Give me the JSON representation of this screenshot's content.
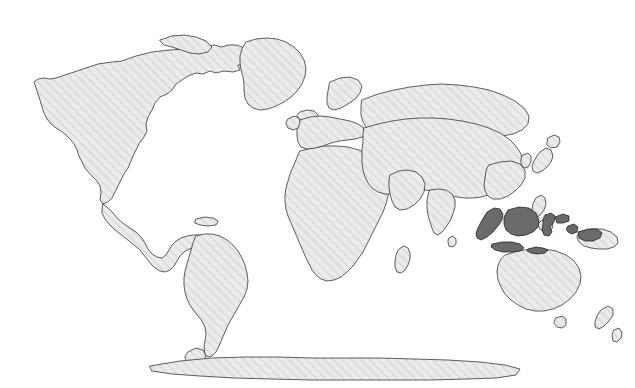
{
  "figure": {
    "kind": "world-map",
    "projection": "equirectangular",
    "width": 635,
    "height": 388,
    "title": "",
    "subtitle": "",
    "caption": "",
    "legend": "",
    "has_text_labels": false,
    "has_graticule": false,
    "has_border_frame": false
  },
  "style": {
    "ocean_color": "#ffffff",
    "background_color": "#ffffff",
    "land_base_color": "#ebebeb",
    "land_hatch_color": "#d6d6d6",
    "land_hatch_angle_deg": 45,
    "land_hatch_spacing_px": 4.5,
    "land_hatch_width_px": 1.6,
    "coastline_color": "#2b2b2b",
    "coastline_width_px": 0.75,
    "highlight_fill_color": "#6a6a6a",
    "highlight_stroke_color": "#1f1f1f",
    "highlight_stroke_width_px": 0.75
  },
  "highlight": {
    "country": "Indonesia",
    "is_highlighted": true,
    "fill": "#6a6a6a",
    "regions": [
      "Sumatra",
      "Java",
      "Kalimantan (Borneo)",
      "Sulawesi",
      "Lesser Sunda Islands",
      "Maluku Islands",
      "Western New Guinea"
    ]
  },
  "regions_rendered": [
    "North America",
    "Greenland",
    "Iceland",
    "Canadian Arctic Archipelago",
    "Central America",
    "Caribbean",
    "South America",
    "Tierra del Fuego",
    "Falkland Islands",
    "Europe",
    "British Isles",
    "Scandinavia",
    "Africa",
    "Madagascar",
    "Arabian Peninsula",
    "Asia",
    "India",
    "Sri Lanka",
    "Japan",
    "Korean Peninsula",
    "Philippines",
    "Indonesia",
    "Papua New Guinea",
    "Australia",
    "Tasmania",
    "New Zealand",
    "Antarctica"
  ],
  "geometry": {
    "north_america": "M 122 61 L 136 56 L 152 52 L 170 50 L 186 49 L 199 49 L 206 46 L 214 45 L 222 47 L 228 45 L 237 45 L 244 48 L 249 47 L 255 50 L 253 55 L 246 57 L 251 61 L 247 65 L 238 65 L 240 70 L 233 72 L 224 71 L 216 73 L 210 71 L 203 74 L 196 73 L 188 76 L 182 80 L 176 84 L 172 90 L 167 94 L 160 97 L 155 103 L 152 110 L 148 117 L 146 124 L 147 131 L 144 137 L 140 142 L 137 148 L 134 154 L 131 161 L 128 168 L 124 174 L 121 180 L 118 186 L 115 192 L 112 198 L 108 202 L 103 204 L 100 200 L 101 193 L 100 186 L 97 181 L 93 177 L 89 173 L 85 168 L 82 162 L 79 156 L 77 150 L 74 144 L 70 139 L 66 135 L 61 131 L 56 128 L 51 124 L 47 119 L 44 113 L 42 107 L 40 100 L 38 94 L 36 88 L 34 82 L 38 79 L 44 78 L 50 79 L 56 78 L 62 76 L 68 74 L 74 72 L 80 70 L 86 68 L 92 66 L 98 64 L 105 63 L 112 62 Z",
    "usa_mexico": "M 103 204 L 108 208 L 113 213 L 118 219 L 124 224 L 130 228 L 136 232 L 141 237 L 145 243 L 148 249 L 152 254 L 157 257 L 162 258 L 166 255 L 169 250 L 172 245 L 176 241 L 181 238 L 187 236 L 193 235 L 199 235 L 205 236 L 211 238 L 216 241 L 220 245 L 223 250 L 225 255 L 222 258 L 217 257 L 212 254 L 207 251 L 201 249 L 195 248 L 189 249 L 184 252 L 180 256 L 177 261 L 174 266 L 170 270 L 165 272 L 160 271 L 155 268 L 151 264 L 147 259 L 143 254 L 139 249 L 134 245 L 129 241 L 124 237 L 119 233 L 114 229 L 109 224 L 105 219 L 102 213 Z",
    "greenland": "M 246 42 L 256 39 L 267 38 L 277 39 L 286 42 L 294 47 L 300 53 L 304 60 L 306 68 L 305 76 L 302 84 L 297 91 L 291 97 L 284 102 L 276 106 L 268 109 L 260 110 L 253 108 L 248 104 L 245 98 L 244 91 L 244 84 L 243 77 L 241 70 L 240 63 L 240 56 L 242 49 Z",
    "iceland": "M 300 112 L 307 110 L 314 111 L 318 115 L 317 120 L 311 123 L 304 123 L 299 120 L 297 116 Z",
    "arctic_islands": "M 160 40 L 172 36 L 184 35 L 196 37 L 206 41 L 212 47 L 208 52 L 199 54 L 190 53 L 181 50 L 172 47 L 164 45 Z",
    "south_america": "M 196 236 L 204 234 L 212 234 L 220 236 L 227 240 L 233 245 L 238 251 L 242 258 L 245 265 L 247 273 L 248 281 L 247 289 L 244 297 L 240 304 L 236 311 L 232 318 L 228 325 L 225 332 L 222 339 L 219 346 L 216 352 L 212 356 L 208 357 L 205 354 L 204 348 L 205 341 L 206 334 L 205 327 L 202 321 L 198 316 L 194 311 L 190 305 L 187 299 L 185 292 L 184 285 L 184 278 L 185 271 L 187 264 L 189 257 L 191 250 L 193 243 Z",
    "africa": "M 300 151 L 312 148 L 324 146 L 336 146 L 348 147 L 359 150 L 368 154 L 376 159 L 382 165 L 386 172 L 388 180 L 389 188 L 388 196 L 386 204 L 383 212 L 379 220 L 375 228 L 371 236 L 367 244 L 363 252 L 358 259 L 353 266 L 347 272 L 341 277 L 334 280 L 327 281 L 321 279 L 316 275 L 312 270 L 309 264 L 306 258 L 303 251 L 300 244 L 297 237 L 294 230 L 291 223 L 288 216 L 286 209 L 285 202 L 285 195 L 286 188 L 288 181 L 290 174 L 293 167 L 296 160 Z",
    "madagascar": "M 399 249 L 404 246 L 408 248 L 410 253 L 410 259 L 408 265 L 405 270 L 401 273 L 397 272 L 395 267 L 395 261 L 396 255 Z",
    "europe": "M 300 120 L 310 117 L 320 116 L 330 117 L 340 119 L 350 121 L 358 124 L 364 128 L 366 133 L 362 137 L 355 139 L 347 140 L 339 141 L 331 143 L 323 146 L 315 148 L 307 149 L 301 147 L 298 142 L 297 136 L 297 130 L 298 124 Z",
    "british_isles": "M 288 119 L 294 116 L 299 118 L 300 123 L 298 128 L 293 130 L 288 128 L 286 124 Z",
    "scandinavia": "M 330 82 L 340 78 L 350 77 L 358 80 L 362 86 L 360 93 L 355 99 L 348 104 L 341 108 L 334 110 L 329 108 L 327 103 L 327 97 L 328 91 Z",
    "asia": "M 364 128 L 378 124 L 392 121 L 406 119 L 420 118 L 434 118 L 448 119 L 462 121 L 476 124 L 489 128 L 500 133 L 509 139 L 516 146 L 521 154 L 523 162 L 522 170 L 518 177 L 512 183 L 505 188 L 497 192 L 489 195 L 481 197 L 473 198 L 465 198 L 457 197 L 449 195 L 441 193 L 433 191 L 425 190 L 417 190 L 409 191 L 401 193 L 393 194 L 385 194 L 378 192 L 372 188 L 368 183 L 365 177 L 363 170 L 362 163 L 362 156 L 362 149 L 363 142 L 363 135 Z",
    "siberia_north": "M 362 100 L 378 94 L 394 90 L 410 87 L 426 85 L 442 84 L 458 85 L 474 87 L 489 90 L 503 95 L 515 101 L 524 108 L 529 116 L 528 124 L 522 130 L 513 134 L 502 136 L 490 137 L 478 137 L 466 136 L 454 135 L 442 134 L 430 134 L 418 135 L 406 136 L 394 137 L 383 136 L 374 133 L 367 128 L 363 122 L 361 115 L 361 107 Z",
    "india": "M 430 190 L 438 189 L 446 190 L 452 194 L 455 200 L 455 207 L 453 214 L 450 221 L 446 227 L 442 232 L 438 235 L 434 233 L 432 228 L 430 222 L 428 215 L 427 208 L 427 201 L 428 195 Z",
    "sri_lanka": "M 449 238 L 453 236 L 456 239 L 456 244 L 453 247 L 449 246 L 448 242 Z",
    "arabian_peninsula": "M 390 175 L 399 171 L 408 170 L 416 172 L 422 177 L 425 184 L 424 192 L 420 199 L 414 205 L 407 209 L 400 210 L 395 207 L 392 201 L 390 194 L 389 187 L 389 181 Z",
    "japan": "M 540 152 L 546 148 L 551 150 L 553 156 L 551 162 L 547 167 L 542 171 L 537 173 L 533 171 L 532 166 L 534 161 L 537 156 Z",
    "japan_north": "M 548 138 L 554 135 L 559 137 L 560 142 L 557 147 L 551 148 L 547 145 Z",
    "korea": "M 523 155 L 528 153 L 531 156 L 531 162 L 528 167 L 524 168 L 521 164 L 521 159 Z",
    "china_east": "M 489 165 L 500 162 L 511 161 L 520 164 L 525 170 L 525 178 L 521 185 L 515 191 L 508 196 L 500 199 L 493 199 L 488 196 L 485 191 L 484 185 L 485 178 L 486 171 Z",
    "philippines": "M 536 198 L 541 195 L 545 198 L 546 204 L 544 210 L 540 215 L 536 218 L 533 215 L 532 210 L 533 204 Z",
    "philippines_south": "M 541 221 L 547 219 L 552 222 L 553 227 L 550 231 L 544 232 L 540 229 L 538 225 Z",
    "papua_new_guinea": "M 580 232 L 591 229 L 602 229 L 611 232 L 617 237 L 618 243 L 614 247 L 607 249 L 599 249 L 591 248 L 584 246 L 579 242 L 577 237 Z",
    "australia": "M 505 255 L 518 251 L 531 249 L 544 249 L 556 251 L 566 255 L 574 261 L 579 268 L 581 276 L 580 284 L 576 292 L 570 299 L 562 305 L 553 309 L 544 311 L 535 311 L 526 309 L 518 305 L 511 300 L 505 294 L 501 287 L 498 280 L 497 272 L 498 265 L 501 259 Z",
    "tasmania": "M 556 318 L 562 316 L 566 319 L 566 325 L 562 328 L 557 327 L 554 323 Z",
    "new_zealand": "M 601 310 L 608 306 L 613 309 L 613 315 L 609 321 L 604 326 L 599 329 L 595 327 L 595 322 L 597 316 Z",
    "new_zealand_south": "M 614 330 L 619 328 L 622 332 L 621 338 L 617 342 L 613 341 L 612 336 Z",
    "antarctica": "M 150 366 L 180 361 L 212 358 L 245 357 L 278 357 L 312 358 L 346 358 L 380 358 L 414 359 L 448 360 L 480 362 L 505 365 L 520 369 L 516 375 L 496 378 L 466 379 L 430 380 L 392 380 L 352 380 L 312 380 L 272 379 L 234 378 L 200 376 L 172 374 L 152 371 Z",
    "antarctic_peninsula": "M 188 352 L 196 348 L 203 350 L 206 356 L 204 362 L 198 366 L 191 366 L 186 362 L 185 357 Z",
    "caribbean": "M 196 219 L 205 217 L 213 218 L 218 221 L 216 225 L 208 226 L 200 225 L 195 223 Z",
    "indonesia_sumatra": "M 487 212 L 494 208 L 500 209 L 503 214 L 502 220 L 498 226 L 493 232 L 487 237 L 481 240 L 477 238 L 476 233 L 478 228 L 481 222 L 484 217 Z",
    "indonesia_java": "M 492 244 L 502 242 L 512 242 L 520 244 L 524 248 L 520 251 L 512 252 L 503 252 L 495 250 L 491 247 Z",
    "indonesia_kalimantan": "M 508 210 L 519 207 L 529 208 L 536 213 L 539 220 L 538 227 L 533 232 L 526 235 L 518 236 L 511 234 L 506 230 L 504 224 L 504 217 Z",
    "indonesia_sulawesi": "M 545 215 L 551 213 L 555 216 L 554 222 L 550 227 L 552 232 L 549 236 L 544 235 L 542 230 L 543 224 L 543 219 Z",
    "indonesia_sulawesi_arm": "M 555 217 L 563 214 L 569 216 L 569 221 L 563 223 L 557 223 Z",
    "indonesia_lesser_sunda": "M 528 249 L 536 247 L 543 248 L 548 250 L 545 253 L 538 254 L 531 253 L 527 251 Z",
    "indonesia_maluku": "M 568 226 L 574 224 L 578 227 L 577 232 L 572 234 L 568 232 L 566 229 Z",
    "indonesia_papua": "M 578 232 L 588 229 L 597 229 L 602 233 L 600 238 L 593 241 L 585 241 L 579 238 Z"
  }
}
